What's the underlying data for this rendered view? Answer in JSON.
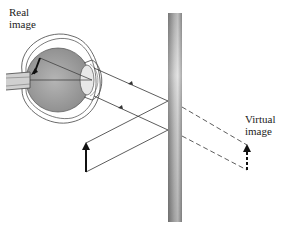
{
  "diagram": {
    "labels": {
      "real_image": [
        "Real",
        "image"
      ],
      "virtual_image": [
        "Virtual",
        "image"
      ]
    },
    "elements": {
      "eye": {
        "description": "cross-section of human eye with inverted real image on retina"
      },
      "mirror": {
        "description": "vertical plane mirror",
        "x": 168,
        "y_top": 13,
        "width": 14,
        "height": 209
      },
      "object_arrow": {
        "description": "solid upright arrow (object)",
        "x": 86,
        "y_base": 172,
        "y_tip": 143
      },
      "virtual_arrow": {
        "description": "dashed upright arrow behind mirror (virtual image)",
        "x": 247,
        "y_base": 170,
        "y_tip": 145
      },
      "rays": [
        {
          "from": "object tip",
          "to": "mirror",
          "style": "solid"
        },
        {
          "from": "object base",
          "to": "mirror",
          "style": "solid"
        },
        {
          "from": "mirror",
          "to": "eye",
          "style": "solid",
          "arrow": true
        },
        {
          "from": "mirror",
          "to": "eye",
          "style": "solid",
          "arrow": true
        },
        {
          "from": "mirror",
          "to": "virtual image",
          "style": "dashed"
        }
      ]
    },
    "colors": {
      "line": "#333333",
      "eye_fill": "#9a9a9a",
      "mirror_dark": "#7a7a7a",
      "mirror_light": "#d8d8d8"
    }
  }
}
